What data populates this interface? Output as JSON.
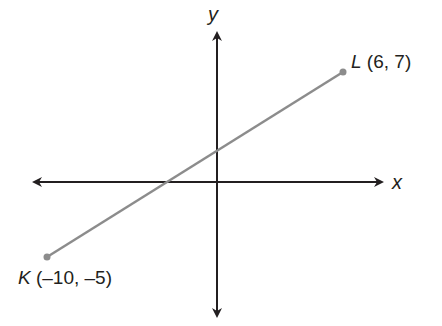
{
  "diagram": {
    "type": "coordinate-plane",
    "x_axis_label": "x",
    "y_axis_label": "y",
    "segment": {
      "name": "KL",
      "color": "#8c8c8c"
    },
    "points": [
      {
        "name": "K",
        "coords": "(–10, –5)",
        "x": -10,
        "y": -5
      },
      {
        "name": "L",
        "coords": "(6, 7)",
        "x": 6,
        "y": 7
      }
    ],
    "axis_color": "#231f20"
  }
}
